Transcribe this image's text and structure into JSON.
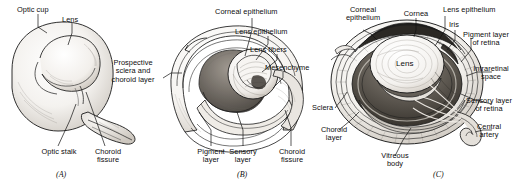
{
  "figure": {
    "type": "anatomical-illustration",
    "background": "#ffffff",
    "ink": "#111111",
    "panel_count": 3
  },
  "panels": [
    {
      "id": "A",
      "caption": "(A)",
      "subject": "Optic cup with lens vesicle and optic stalk",
      "labels": [
        {
          "key": "optic_cup",
          "text": "Optic cup"
        },
        {
          "key": "lens",
          "text": "Lens"
        },
        {
          "key": "optic_stalk",
          "text": "Optic stalk"
        },
        {
          "key": "choroid_fissure",
          "text": "Choroid\nfissure"
        }
      ]
    },
    {
      "id": "B",
      "caption": "(B)",
      "subject": "Developing eye showing cornea, lens and retinal layers",
      "labels": [
        {
          "key": "corneal_epithelium",
          "text": "Corneal epithelium"
        },
        {
          "key": "lens_epithelium",
          "text": "Lens epithelium"
        },
        {
          "key": "lens_fibers",
          "text": "Lens fibers"
        },
        {
          "key": "mesenchyme",
          "text": "Mesenchyme"
        },
        {
          "key": "prospective_sclera",
          "text": "Prospective\nsclera and\nchoroid layer"
        },
        {
          "key": "pigment_layer",
          "text": "Pigment\nlayer"
        },
        {
          "key": "sensory_layer",
          "text": "Sensory\nlayer"
        },
        {
          "key": "choroid_fissure",
          "text": "Choroid\nfissure"
        }
      ]
    },
    {
      "id": "C",
      "caption": "(C)",
      "subject": "Definitive eye in cross-section",
      "inner_label": "Lens",
      "labels": [
        {
          "key": "corneal_epithelium",
          "text": "Corneal\nepithelium"
        },
        {
          "key": "cornea",
          "text": "Cornea"
        },
        {
          "key": "lens_epithelium",
          "text": "Lens epithelium"
        },
        {
          "key": "iris",
          "text": "Iris"
        },
        {
          "key": "pigment_layer",
          "text": "Pigment layer\nof retina"
        },
        {
          "key": "intraretinal_space",
          "text": "Intraretinal\nspace"
        },
        {
          "key": "sensory_layer",
          "text": "Sensory layer\nof retina"
        },
        {
          "key": "central_artery",
          "text": "Central\nartery"
        },
        {
          "key": "sclera",
          "text": "Sclera"
        },
        {
          "key": "choroid_layer",
          "text": "Choroid\nlayer"
        },
        {
          "key": "vitreous_body",
          "text": "Vitreous\nbody"
        }
      ]
    }
  ]
}
